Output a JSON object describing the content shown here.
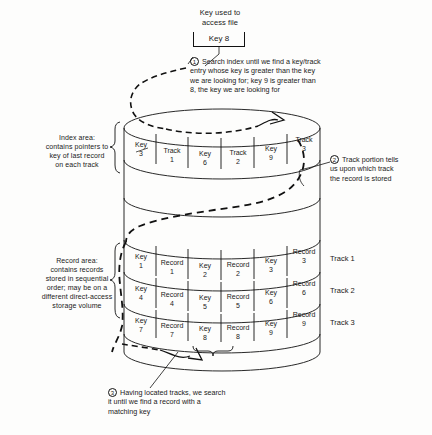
{
  "title_block": {
    "caption": "Key used to\naccess file",
    "key_value": "Key 8"
  },
  "annotations": [
    {
      "num": "1",
      "text": "Search index until we find a key/track\nentry whose key is greater than the key\nwe are looking for; key 9 is greater than\n8, the key we are looking for"
    },
    {
      "num": "2",
      "text": "Track portion tells\nus upon which track\nthe record is stored"
    },
    {
      "num": "3",
      "text": "Having located tracks, we search\nit until we find a record with a\nmatching key"
    }
  ],
  "side_labels": {
    "index_area": "Index area:\ncontains pointers to\nkey of last record\non each track",
    "record_area": "Record area:\ncontains records\nstored in sequential\norder; may be on a\ndifferent direct-access\nstorage volume"
  },
  "index_row": {
    "cells": [
      {
        "label": "Key",
        "value": "3"
      },
      {
        "label": "Track",
        "value": "1"
      },
      {
        "label": "Key",
        "value": "6"
      },
      {
        "label": "Track",
        "value": "2"
      },
      {
        "label": "Key",
        "value": "9"
      },
      {
        "label": "Track",
        "value": "3"
      }
    ]
  },
  "record_tracks": [
    {
      "track_label": "Track 1",
      "cells": [
        {
          "label": "Key",
          "value": "1"
        },
        {
          "label": "Record",
          "value": "1"
        },
        {
          "label": "Key",
          "value": "2"
        },
        {
          "label": "Record",
          "value": "2"
        },
        {
          "label": "Key",
          "value": "3"
        },
        {
          "label": "Record",
          "value": "3"
        }
      ]
    },
    {
      "track_label": "Track 2",
      "cells": [
        {
          "label": "Key",
          "value": "4"
        },
        {
          "label": "Record",
          "value": "4"
        },
        {
          "label": "Key",
          "value": "5"
        },
        {
          "label": "Record",
          "value": "5"
        },
        {
          "label": "Key",
          "value": "6"
        },
        {
          "label": "Record",
          "value": "6"
        }
      ]
    },
    {
      "track_label": "Track 3",
      "cells": [
        {
          "label": "Key",
          "value": "7"
        },
        {
          "label": "Record",
          "value": "7"
        },
        {
          "label": "Key",
          "value": "8"
        },
        {
          "label": "Record",
          "value": "8"
        },
        {
          "label": "Key",
          "value": "9"
        },
        {
          "label": "Record",
          "value": "9"
        }
      ]
    }
  ],
  "colors": {
    "ink": "#111111",
    "paper": "#fdfdfc"
  }
}
